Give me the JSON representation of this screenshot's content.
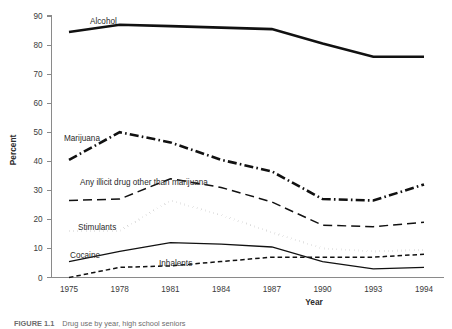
{
  "figure": {
    "caption": "FIGURE 1.1",
    "caption_rest": "Drug use by year, high school seniors"
  },
  "axes": {
    "x_title": "Year",
    "y_title": "Percent",
    "x_ticks": [
      "1975",
      "1978",
      "1981",
      "1984",
      "1987",
      "1990",
      "1993",
      "1994"
    ],
    "y_ticks": [
      "0",
      "10",
      "20",
      "30",
      "40",
      "50",
      "60",
      "70",
      "80",
      "90"
    ]
  },
  "labels": {
    "alcohol": "Alcohol",
    "marijuana": "Marijuana",
    "illicit": "Any illicit drug other than marijuana",
    "stimulants": "Stimulants",
    "cocaine": "Cocaine",
    "inhalents": "Inhalents"
  },
  "chart_data": {
    "type": "line",
    "title": "",
    "xlabel": "Year",
    "ylabel": "Percent",
    "xlim": [
      1975,
      1994
    ],
    "ylim": [
      0,
      90
    ],
    "grid": false,
    "legend": "inline-annotations",
    "x": [
      1975,
      1978,
      1981,
      1984,
      1987,
      1990,
      1993,
      1994
    ],
    "series": [
      {
        "name": "Alcohol",
        "style": "solid-thick",
        "color": "#111111",
        "values": [
          84.5,
          87.0,
          86.5,
          86.0,
          85.5,
          80.5,
          76.0,
          76.0
        ]
      },
      {
        "name": "Marijuana",
        "style": "dash-dot-thick",
        "color": "#111111",
        "values": [
          40.5,
          50.0,
          46.5,
          40.5,
          36.5,
          27.0,
          26.5,
          32.0
        ]
      },
      {
        "name": "Any illicit drug other than marijuana",
        "style": "long-dash",
        "color": "#111111",
        "values": [
          26.5,
          27.0,
          34.0,
          31.0,
          26.0,
          18.0,
          17.5,
          19.0
        ]
      },
      {
        "name": "Stimulants",
        "style": "dotted",
        "color": "#111111",
        "values": [
          16.0,
          16.0,
          26.5,
          21.5,
          15.5,
          10.0,
          9.0,
          9.5
        ]
      },
      {
        "name": "Cocaine",
        "style": "solid-thin",
        "color": "#111111",
        "values": [
          5.5,
          9.0,
          12.0,
          11.5,
          10.5,
          5.5,
          3.0,
          3.5
        ]
      },
      {
        "name": "Inhalents",
        "style": "short-dash",
        "color": "#111111",
        "values": [
          0.0,
          3.5,
          4.0,
          5.5,
          7.0,
          7.0,
          7.0,
          8.0
        ]
      }
    ]
  }
}
